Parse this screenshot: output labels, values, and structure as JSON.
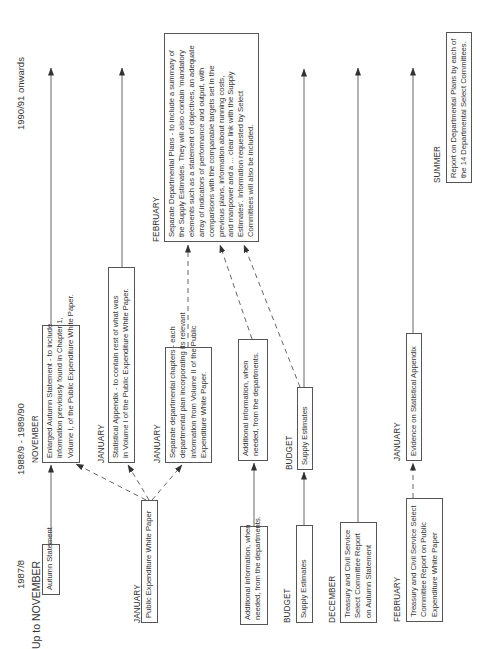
{
  "columns": {
    "col1": {
      "period": "1987/8",
      "subtitle": "Up to NOVEMBER"
    },
    "col2": {
      "period": "1988/9 - 1989/90"
    },
    "col3": {
      "period": "1990/91  onwards"
    }
  },
  "nodes": {
    "autumn_statement": {
      "month": "",
      "lines": [
        "Autumn Statement"
      ]
    },
    "pewp": {
      "month": "JANUARY",
      "lines": [
        "Public Expenditure White Paper"
      ]
    },
    "additional_info_1": {
      "month": "",
      "lines": [
        "Additional information, when",
        "needed, from the departments."
      ]
    },
    "supply_estimates_1": {
      "month": "BUDGET",
      "lines": [
        "Supply Estimates"
      ]
    },
    "tcs_autumn": {
      "month": "DECEMBER",
      "lines": [
        "Treasury and Civil Service",
        "Select Committee Report",
        "on Autumn Statement"
      ]
    },
    "tcs_pewp": {
      "month": "FEBRUARY",
      "lines": [
        "Treasury and Civil Service Select",
        "Committee Report on Public",
        "Expenditure White Paper"
      ]
    },
    "enlarged_autumn": {
      "month": "NOVEMBER",
      "lines": [
        "Enlarged Autumn Statement - to include",
        "information previously found in Chapter 1,",
        "Volume I, of the Public Expenditure White Paper."
      ]
    },
    "statistical_appendix": {
      "month": "JANUARY",
      "lines": [
        "Statistical Appendix - to contain rest of what was",
        "in Volume I of the Public Expenditure White Paper."
      ]
    },
    "dept_chapters": {
      "month": "JANUARY",
      "lines": [
        "Separate departmental chapters - each",
        "departmental plan incorporating its relevant",
        "information from Volume II of the Public",
        "Expenditure White Paper."
      ]
    },
    "additional_info_2": {
      "month": "",
      "lines": [
        "Additional information, when",
        "needed, from the departments."
      ]
    },
    "supply_estimates_2": {
      "month": "BUDGET",
      "lines": [
        "Supply Estimates"
      ]
    },
    "evidence_stat_appendix": {
      "month": "JANUARY",
      "lines": [
        "Evidence on Statistical Appendix"
      ]
    },
    "dept_plans": {
      "month": "FEBRUARY",
      "lines": [
        "Separate Departmental Plans - to include a summary of",
        "the Supply Estimates. They will also contain 'mandatory",
        "elements such as a statement of objectives, an adequate",
        "array of indicators of performance and output, with",
        "comparisons with the comparable targets set in the",
        "previous plans, information about running costs,",
        "and manpower and a ... clear link with the Supply",
        "Estimates'. Information requested by Select",
        "Committees will also be included."
      ]
    },
    "report_dept_plans": {
      "month": "SUMMER",
      "lines": [
        "Report on Departmental Plans by each of",
        "the 14 Departmental Select Committees."
      ]
    }
  },
  "colors": {
    "line": "#555555",
    "text": "#333333",
    "background": "#ffffff"
  }
}
